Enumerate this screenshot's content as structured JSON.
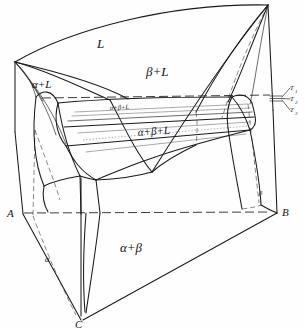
{
  "figure": {
    "kind": "ternary-space-model",
    "background_color": "#ffffff",
    "line_color": "#1a1a1a"
  },
  "vertices": {
    "A": {
      "label": "A",
      "x": 22,
      "y": 213
    },
    "B": {
      "label": "B",
      "x": 277,
      "y": 212
    },
    "C": {
      "label": "C",
      "x": 81,
      "y": 320
    },
    "A_top": {
      "label": "",
      "x": 15,
      "y": 62
    },
    "B_top": {
      "label": "",
      "x": 268,
      "y": 5
    }
  },
  "region_labels": [
    {
      "name": "liquid",
      "text": "L",
      "x": 101,
      "y": 44,
      "size": "lbl-big"
    },
    {
      "name": "alpha-plus-liquid",
      "text": "α+L",
      "x": 40,
      "y": 84,
      "size": "lbl-mid"
    },
    {
      "name": "beta-plus-liquid",
      "text": "β+L",
      "x": 152,
      "y": 72,
      "size": "lbl-big"
    },
    {
      "name": "alpha-plus-beta-plus-liquid-upper",
      "text": "α+β+L",
      "x": 117,
      "y": 108,
      "size": "lbl-sm"
    },
    {
      "name": "alpha-plus-beta-plus-liquid-lower",
      "text": "α+β+L",
      "x": 143,
      "y": 133,
      "size": "lbl-mid"
    },
    {
      "name": "alpha-plus-beta",
      "text": "α+β",
      "x": 128,
      "y": 247,
      "size": "lbl-big"
    },
    {
      "name": "alpha-phase-field",
      "text": "α",
      "x": 48,
      "y": 259,
      "size": "lbl-sm"
    },
    {
      "name": "beta-phase-field",
      "text": "β",
      "x": 260,
      "y": 192,
      "size": "lbl-sm"
    }
  ],
  "isotherms": {
    "name": "isothermal-section-callouts",
    "items": [
      {
        "label": "T",
        "subscript": "1",
        "x": 292,
        "y": 89
      },
      {
        "label": "T",
        "subscript": "2",
        "x": 292,
        "y": 100
      },
      {
        "label": "T",
        "subscript": "3",
        "x": 292,
        "y": 111
      }
    ],
    "tick_x": 276,
    "tick_ys": [
      96,
      98.5,
      101
    ]
  },
  "paths": {
    "prism_left_edge": "M15,62 L22,213",
    "prism_right_edge": "M268,5 L277,212",
    "prism_front_edge": "M81,178 L81,320",
    "base_AB": "M22,213 L277,212",
    "base_AC": "M22,213 L81,320",
    "base_BC": "M277,212 L81,320",
    "top_AB_liquidus": "M15,62 C70,28 170,2 268,5",
    "top_A_to_front": "M15,62 C38,110 58,150 81,178",
    "top_B_to_front": "M268,5 C210,60 150,130 81,178",
    "liquidus_valley": "M15,62 C60,80 120,120 190,120",
    "eutectic_trough": "M56,101 C110,96 175,95 232,96",
    "alpha_liquidus_surface": "M15,62 C48,86 64,120 78,176",
    "beta_liquidus_surface": "M268,5 C236,50 210,96 190,120",
    "alpha_solvus_front": "M38,99 C44,140 52,175 60,198",
    "beta_solvus_front": "M248,100 C252,140 256,176 259,205",
    "three_phase_top": "M56,101 L232,96",
    "three_phase_bottom": "M62,144 L236,129",
    "solidus_front_left": "M62,144 C78,168 96,186 125,196",
    "solidus_front_right": "M125,196 C170,175 205,150 236,129"
  },
  "annotations": {
    "line_style_solid": "solid",
    "line_style_dashed": "dashed (hidden edges)",
    "line_style_dotted": "dotted (tie-lines)"
  }
}
